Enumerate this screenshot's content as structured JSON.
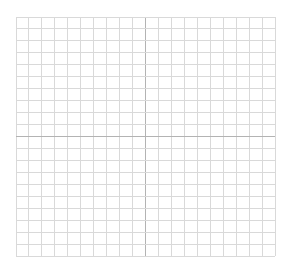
{
  "diagram": {
    "type": "coordinate-grid",
    "columns": 20,
    "rows": 20,
    "axes": {
      "x_axis_row": 10,
      "y_axis_column": 10
    },
    "colors": {
      "grid_line": "#d9d9d9",
      "axis_line": "#b3b3b3",
      "background": "#ffffff"
    }
  }
}
